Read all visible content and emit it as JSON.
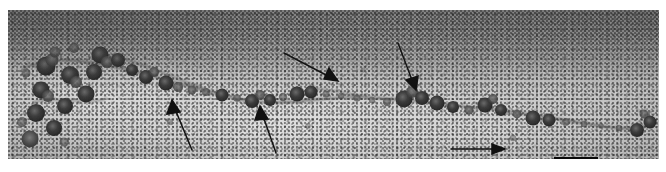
{
  "figure": {
    "caption": "",
    "width_px": 666,
    "height_px": 172,
    "background_color": "#ffffff",
    "plate": {
      "left_px": 8,
      "top_px": 10,
      "width_px": 651,
      "height_px": 149,
      "base_color": "#b4b4b4",
      "stain_dark_color": "#3a3a3a",
      "modality": "negative-stain TEM",
      "specimen": "beads-on-a-string nucleosome array"
    }
  },
  "scale_bar": {
    "label": "",
    "color": "#0a0a0a",
    "left_px": 546,
    "top_px": 147,
    "width_px": 44,
    "height_px": 3
  },
  "annotations": {
    "arrow_color": "#111111",
    "arrows": [
      {
        "id": "arrow-1",
        "label": "",
        "direction": "up-left",
        "tail_x": 184,
        "tail_y": 140,
        "head_x": 164,
        "head_y": 94
      },
      {
        "id": "arrow-2",
        "label": "",
        "direction": "up",
        "tail_x": 268,
        "tail_y": 143,
        "head_x": 253,
        "head_y": 100
      },
      {
        "id": "arrow-3",
        "label": "",
        "direction": "down-right",
        "tail_x": 276,
        "tail_y": 43,
        "head_x": 327,
        "head_y": 70
      },
      {
        "id": "arrow-4",
        "label": "",
        "direction": "down",
        "tail_x": 390,
        "tail_y": 33,
        "head_x": 407,
        "head_y": 78
      },
      {
        "id": "arrow-5",
        "label": "",
        "direction": "right",
        "tail_x": 443,
        "tail_y": 140,
        "head_x": 494,
        "head_y": 139
      }
    ]
  },
  "particles": {
    "description": "nucleosome core particles rendered as dark stain-excluding globules",
    "fill_dark": "#4c4c4c",
    "fill_core": "#2e2e2e",
    "cluster_left": [
      {
        "cx": 38,
        "cy": 56,
        "r": 9.5
      },
      {
        "cx": 33,
        "cy": 80,
        "r": 8.5
      },
      {
        "cx": 28,
        "cy": 103,
        "r": 9.0
      },
      {
        "cx": 46,
        "cy": 118,
        "r": 8.0
      },
      {
        "cx": 22,
        "cy": 129,
        "r": 8.5
      },
      {
        "cx": 57,
        "cy": 96,
        "r": 8.0
      },
      {
        "cx": 62,
        "cy": 65,
        "r": 9.0
      },
      {
        "cx": 78,
        "cy": 84,
        "r": 8.5
      },
      {
        "cx": 86,
        "cy": 62,
        "r": 8.0
      },
      {
        "cx": 92,
        "cy": 45,
        "r": 8.5
      },
      {
        "cx": 104,
        "cy": 52,
        "r": 7.5
      },
      {
        "cx": 47,
        "cy": 42,
        "r": 6.0
      },
      {
        "cx": 66,
        "cy": 38,
        "r": 5.5
      },
      {
        "cx": 18,
        "cy": 63,
        "r": 5.0
      }
    ],
    "fiber_beads": [
      {
        "cx": 124,
        "cy": 60,
        "r": 6.0
      },
      {
        "cx": 138,
        "cy": 67,
        "r": 7.0
      },
      {
        "cx": 152,
        "cy": 72,
        "r": 7.5
      },
      {
        "cx": 167,
        "cy": 76,
        "r": 5.5
      },
      {
        "cx": 183,
        "cy": 79,
        "r": 5.0
      },
      {
        "cx": 198,
        "cy": 82,
        "r": 4.5
      },
      {
        "cx": 214,
        "cy": 85,
        "r": 6.5
      },
      {
        "cx": 229,
        "cy": 88,
        "r": 4.0
      },
      {
        "cx": 243,
        "cy": 91,
        "r": 7.0
      },
      {
        "cx": 258,
        "cy": 90,
        "r": 6.0
      },
      {
        "cx": 273,
        "cy": 87,
        "r": 4.5
      },
      {
        "cx": 288,
        "cy": 84,
        "r": 7.5
      },
      {
        "cx": 302,
        "cy": 82,
        "r": 6.5
      },
      {
        "cx": 318,
        "cy": 83,
        "r": 4.0
      },
      {
        "cx": 333,
        "cy": 85,
        "r": 3.5
      },
      {
        "cx": 349,
        "cy": 88,
        "r": 4.0
      },
      {
        "cx": 364,
        "cy": 90,
        "r": 3.5
      },
      {
        "cx": 379,
        "cy": 92,
        "r": 4.5
      },
      {
        "cx": 395,
        "cy": 90,
        "r": 8.5
      },
      {
        "cx": 412,
        "cy": 86,
        "r": 7.0
      },
      {
        "cx": 428,
        "cy": 92,
        "r": 7.5
      },
      {
        "cx": 444,
        "cy": 96,
        "r": 6.0
      },
      {
        "cx": 460,
        "cy": 99,
        "r": 5.0
      },
      {
        "cx": 476,
        "cy": 95,
        "r": 7.5
      },
      {
        "cx": 492,
        "cy": 99,
        "r": 6.0
      },
      {
        "cx": 508,
        "cy": 104,
        "r": 4.5
      },
      {
        "cx": 524,
        "cy": 108,
        "r": 7.5
      },
      {
        "cx": 540,
        "cy": 110,
        "r": 6.5
      },
      {
        "cx": 558,
        "cy": 112,
        "r": 4.0
      },
      {
        "cx": 575,
        "cy": 114,
        "r": 3.5
      },
      {
        "cx": 592,
        "cy": 116,
        "r": 3.0
      },
      {
        "cx": 610,
        "cy": 118,
        "r": 3.5
      },
      {
        "cx": 628,
        "cy": 120,
        "r": 7.0
      },
      {
        "cx": 641,
        "cy": 112,
        "r": 6.5
      }
    ]
  }
}
